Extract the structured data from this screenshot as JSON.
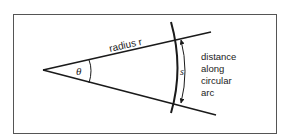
{
  "diagram": {
    "type": "arc-length-geometry",
    "labels": {
      "radius": "radius r",
      "angle": "θ",
      "arc_symbol": "s",
      "arc_description": [
        "distance",
        "along",
        "circular",
        "arc"
      ]
    },
    "colors": {
      "stroke": "#1a1a1a",
      "border": "#555555",
      "background": "#ffffff"
    }
  }
}
